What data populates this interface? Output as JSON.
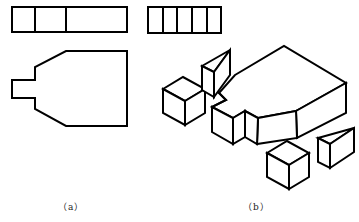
{
  "figure": {
    "panels": [
      {
        "id": "a",
        "caption": "（a）",
        "description": "Orthographic views: top view strip with 3 cells, front view of a stepped pentagonal plate with a small tab"
      },
      {
        "id": "b",
        "caption": "（b）",
        "description": "Isometric view of the assembled plate with exploded cut-off pieces (two cubes, two wedges) and a 5-cell top strip"
      }
    ],
    "colors": {
      "line": "#000000",
      "background": "#ffffff"
    }
  }
}
